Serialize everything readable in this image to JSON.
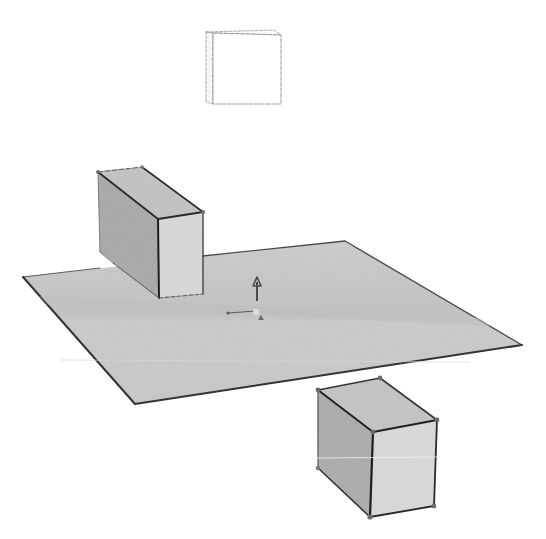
{
  "scene": {
    "width": 546,
    "height": 539,
    "background": "#ffffff",
    "colors": {
      "plane_fill": "#c9c9c9",
      "plane_edge": "#3a3a3a",
      "box_top": "#c4c4c4",
      "box_left": "#a9a9a9",
      "box_front": "#d8d8d8",
      "box_edge": "#2e2e2e",
      "vertex": "#6b6b6b",
      "ghost_edge": "#9a9a9a",
      "gizmo": "#4a4a4a",
      "streak": "#eeeeee"
    },
    "objects": [
      {
        "id": "ghost-square",
        "description": "Floating thin slab drawn as faint outline (unselected / hidden geometry)",
        "front": [
          [
            213,
            33
          ],
          [
            281,
            35
          ],
          [
            281,
            104
          ],
          [
            213,
            104
          ]
        ],
        "side": [
          [
            206,
            32
          ],
          [
            213,
            33
          ],
          [
            213,
            104
          ],
          [
            206,
            102
          ]
        ]
      },
      {
        "id": "ground-plane",
        "description": "Large flat square plane seen in perspective",
        "corners": [
          [
            23,
            277
          ],
          [
            345,
            241
          ],
          [
            522,
            345
          ],
          [
            135,
            404
          ]
        ]
      },
      {
        "id": "box-upper-left",
        "description": "Rectangular box partly behind the plane",
        "top": [
          [
            98,
            172
          ],
          [
            142,
            167
          ],
          [
            203,
            212
          ],
          [
            158,
            219
          ]
        ],
        "left": [
          [
            98,
            172
          ],
          [
            158,
            219
          ],
          [
            159,
            298
          ],
          [
            100,
            252
          ]
        ],
        "front": [
          [
            158,
            219
          ],
          [
            203,
            212
          ],
          [
            203,
            294
          ],
          [
            159,
            298
          ]
        ]
      },
      {
        "id": "box-lower-right",
        "description": "Rectangular box below the plane with vertex handles",
        "top": [
          [
            318,
            390
          ],
          [
            380,
            378
          ],
          [
            437,
            420
          ],
          [
            373,
            432
          ]
        ],
        "left": [
          [
            318,
            390
          ],
          [
            373,
            432
          ],
          [
            370,
            517
          ],
          [
            318,
            468
          ]
        ],
        "front": [
          [
            373,
            432
          ],
          [
            437,
            420
          ],
          [
            434,
            506
          ],
          [
            370,
            517
          ]
        ],
        "vertices": [
          [
            318,
            390
          ],
          [
            380,
            378
          ],
          [
            437,
            420
          ],
          [
            373,
            432
          ],
          [
            370,
            517
          ],
          [
            434,
            506
          ],
          [
            318,
            468
          ]
        ]
      },
      {
        "id": "axis-gizmo",
        "description": "Origin axis gizmo with up arrow",
        "up_arrow": {
          "x": 257,
          "y1": 301,
          "y2": 278
        },
        "x_axis": {
          "x1": 228,
          "y1": 313,
          "x2": 255,
          "y2": 311
        },
        "marker": [
          [
            258,
            320
          ],
          [
            261,
            315
          ],
          [
            264,
            320
          ]
        ]
      }
    ]
  }
}
